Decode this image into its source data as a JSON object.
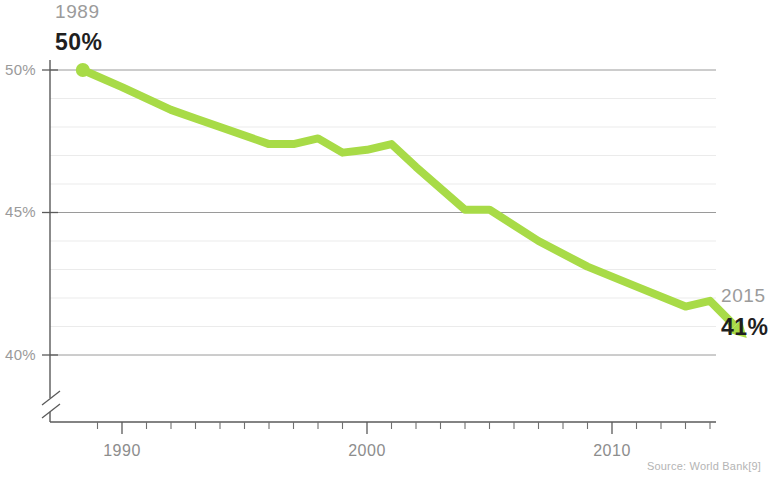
{
  "chart_data": {
    "type": "line",
    "title": "",
    "subtitle": "",
    "xlabel": "",
    "ylabel": "",
    "grid": true,
    "legend": null,
    "xlim": [
      1988.4,
      1988.4
    ],
    "ylim": [
      39.0,
      50.4
    ],
    "xtick_labels": [
      "1990",
      "2000",
      "2010"
    ],
    "xtick_values": [
      1990,
      2000,
      2010
    ],
    "ytick_labels": [
      "50%",
      "45%",
      "40%"
    ],
    "ytick_values": [
      50,
      45,
      40
    ],
    "minor_gridlines_every": 1,
    "axis_break": true,
    "series": [
      {
        "name": "World Bank share",
        "color": "#a8db47",
        "x": [
          1988.4,
          1990,
          1992,
          1993,
          1994,
          1996,
          1997,
          1998,
          1999,
          2000,
          2001,
          2002,
          2004,
          2005,
          2007,
          2009,
          2011,
          2013,
          2014,
          2015.5
        ],
        "values": [
          50.0,
          49.4,
          48.6,
          48.3,
          48.0,
          47.4,
          47.4,
          47.6,
          47.1,
          47.2,
          47.4,
          46.6,
          45.1,
          45.1,
          44.0,
          43.1,
          42.4,
          41.7,
          41.9,
          40.6
        ]
      }
    ],
    "start_marker": {
      "x": 1988.4,
      "y": 50.0,
      "shape": "circle"
    },
    "end_marker": {
      "x": 2015.5,
      "y": 40.6,
      "shape": "arrow"
    }
  },
  "annotations": {
    "start": {
      "year": "1989",
      "value": "50%"
    },
    "end": {
      "year": "2015",
      "value": "41%"
    }
  },
  "source": {
    "text": "Source: World Bank[9]"
  },
  "colors": {
    "line": "#a8db47",
    "grid_minor": "#e2e2e2",
    "grid_major": "#8e8e8e",
    "axis": "#5a5a5a",
    "label_gray": "#9a9a9a",
    "value_dark": "#1f1f1f"
  }
}
